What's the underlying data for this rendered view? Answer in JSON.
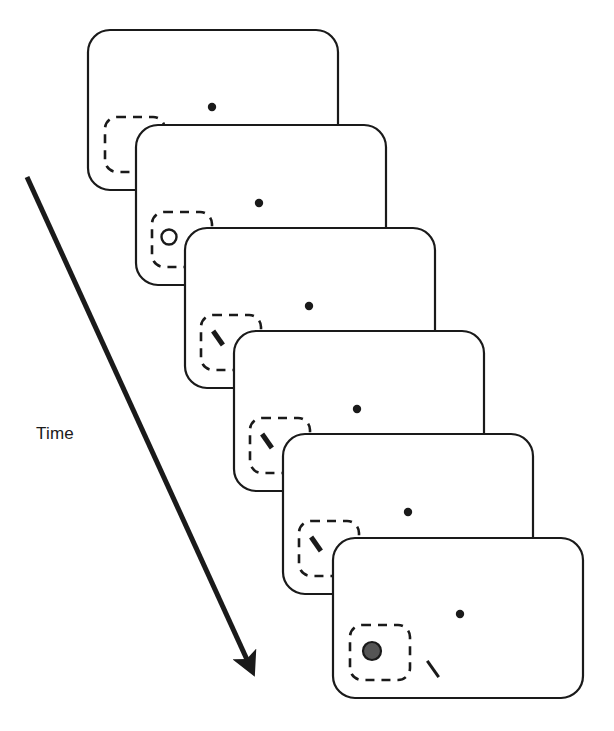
{
  "figure": {
    "kind": "trial-sequence-diagram",
    "background_color": "#ffffff",
    "stroke_color": "#1a1a1a",
    "time_axis": {
      "label": "Time",
      "label_x": 36,
      "label_y": 424,
      "arrow": {
        "x1": 27,
        "y1": 177,
        "x2": 249,
        "y2": 664,
        "width": 5
      },
      "direction": "down-right"
    },
    "panel_style": {
      "width": 250,
      "height": 160,
      "corner_radius": 22,
      "stroke_width": 2.2,
      "fill": "#ffffff"
    },
    "cue_box_style": {
      "width": 60,
      "height": 55,
      "corner_radius": 12,
      "stroke_width": 2.6,
      "dash": "9 7"
    },
    "fixation_dot_style": {
      "radius": 4.2,
      "fill": "#1a1a1a"
    },
    "open_circle_style": {
      "radius": 7.5,
      "stroke_width": 2.4,
      "fill": "#ffffff"
    },
    "bar_style": {
      "length": 17,
      "thickness": 5,
      "angle_deg": 55
    },
    "thin_bar_style": {
      "length": 20,
      "thickness": 3,
      "angle_deg": 55
    },
    "gray_disc_style": {
      "radius": 9,
      "fill": "#555555",
      "stroke_width": 2.2
    },
    "panels": [
      {
        "index": 1,
        "name": "panel-fixation-cue",
        "x": 88,
        "y": 30,
        "cue_box": {
          "x": 105,
          "y": 117
        },
        "fixation_dot": {
          "x": 212,
          "y": 107
        },
        "open_circles": [],
        "bars": [],
        "thin_bars": [],
        "gray_disc": null
      },
      {
        "index": 2,
        "name": "panel-placeholders",
        "x": 136,
        "y": 125,
        "cue_box": {
          "x": 152,
          "y": 212
        },
        "fixation_dot": {
          "x": 259,
          "y": 203
        },
        "open_circles": [
          {
            "x": 169,
            "y": 237
          },
          {
            "x": 243,
            "y": 259
          }
        ],
        "bars": [],
        "thin_bars": [],
        "gray_disc": null
      },
      {
        "index": 3,
        "name": "panel-stimulus-1",
        "x": 185,
        "y": 228,
        "cue_box": {
          "x": 201,
          "y": 315
        },
        "fixation_dot": {
          "x": 309,
          "y": 306
        },
        "open_circles": [],
        "bars": [
          {
            "x": 218,
            "y": 338
          },
          {
            "x": 291,
            "y": 361
          }
        ],
        "thin_bars": [],
        "gray_disc": null
      },
      {
        "index": 4,
        "name": "panel-stimulus-2",
        "x": 234,
        "y": 331,
        "cue_box": {
          "x": 250,
          "y": 418
        },
        "fixation_dot": {
          "x": 357,
          "y": 409
        },
        "open_circles": [],
        "bars": [
          {
            "x": 267,
            "y": 441
          },
          {
            "x": 335,
            "y": 464
          }
        ],
        "thin_bars": [],
        "gray_disc": null
      },
      {
        "index": 5,
        "name": "panel-stimulus-3",
        "x": 283,
        "y": 434,
        "cue_box": {
          "x": 299,
          "y": 521
        },
        "fixation_dot": {
          "x": 408,
          "y": 512
        },
        "open_circles": [],
        "bars": [
          {
            "x": 316,
            "y": 544
          },
          {
            "x": 385,
            "y": 567
          }
        ],
        "thin_bars": [],
        "gray_disc": null
      },
      {
        "index": 6,
        "name": "panel-probe-response",
        "x": 333,
        "y": 538,
        "cue_box": {
          "x": 350,
          "y": 625
        },
        "fixation_dot": {
          "x": 460,
          "y": 614
        },
        "open_circles": [],
        "bars": [],
        "thin_bars": [
          {
            "x": 433,
            "y": 669
          }
        ],
        "gray_disc": {
          "x": 372,
          "y": 651
        }
      }
    ]
  }
}
